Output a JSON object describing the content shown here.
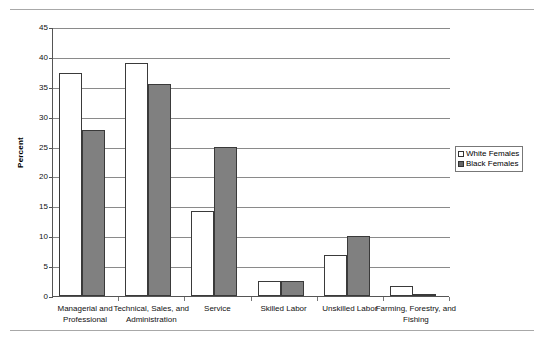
{
  "chart_data": {
    "type": "bar",
    "title": "",
    "xlabel": "",
    "ylabel": "Percent",
    "ylim": [
      0,
      45
    ],
    "ytick_step": 5,
    "grid": true,
    "legend_position": "right",
    "categories": [
      "Managerial and Professional",
      "Technical, Sales, and Administration",
      "Service",
      "Skilled Labor",
      "Unskilled Labor",
      "Farming, Forestry, and Fishing"
    ],
    "yticks": [
      "0",
      "5",
      "10",
      "15",
      "20",
      "25",
      "30",
      "35",
      "40",
      "45"
    ],
    "series": [
      {
        "name": "White Females",
        "color": "#ffffff",
        "values": [
          37.3,
          38.9,
          14.2,
          2.5,
          6.8,
          1.6
        ]
      },
      {
        "name": "Black Females",
        "color": "#808080",
        "values": [
          27.7,
          35.4,
          25.0,
          2.5,
          10.0,
          0.3
        ]
      }
    ]
  },
  "legend": {
    "items": [
      {
        "label": "White Females",
        "swatch": "white-square-icon"
      },
      {
        "label": "Black Females",
        "swatch": "black-square-icon"
      }
    ]
  },
  "axis": {
    "y_title": "Percent"
  }
}
